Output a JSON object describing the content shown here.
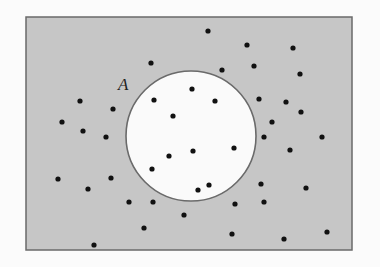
{
  "diagram": {
    "type": "venn-set-with-points",
    "colors": {
      "page_background": "#fbfbfb",
      "universe_fill": "#c6c6c6",
      "universe_stroke": "#6a6a6a",
      "set_fill": "#fafafa",
      "set_stroke": "#6a6a6a",
      "point": "#111111",
      "label": "#222222"
    },
    "universe": {
      "x": 26,
      "y": 17,
      "width": 326,
      "height": 233
    },
    "set_A": {
      "label": "A",
      "label_x": 118,
      "label_y": 90,
      "cx": 191,
      "cy": 136,
      "r": 65
    },
    "point_radius": 2.6,
    "points_inside_A": [
      [
        192,
        89
      ],
      [
        154,
        100
      ],
      [
        215,
        101
      ],
      [
        173,
        116
      ],
      [
        169,
        156
      ],
      [
        193,
        151
      ],
      [
        234,
        148
      ],
      [
        152,
        169
      ],
      [
        209,
        185
      ],
      [
        198,
        190
      ]
    ],
    "points_outside_A": [
      [
        208,
        31
      ],
      [
        247,
        45
      ],
      [
        293,
        48
      ],
      [
        151,
        63
      ],
      [
        222,
        70
      ],
      [
        254,
        66
      ],
      [
        300,
        74
      ],
      [
        80,
        101
      ],
      [
        113,
        109
      ],
      [
        259,
        99
      ],
      [
        286,
        102
      ],
      [
        301,
        112
      ],
      [
        62,
        122
      ],
      [
        83,
        131
      ],
      [
        106,
        137
      ],
      [
        272,
        122
      ],
      [
        264,
        137
      ],
      [
        322,
        137
      ],
      [
        290,
        150
      ],
      [
        58,
        179
      ],
      [
        111,
        178
      ],
      [
        88,
        189
      ],
      [
        129,
        202
      ],
      [
        153,
        202
      ],
      [
        184,
        215
      ],
      [
        144,
        228
      ],
      [
        94,
        245
      ],
      [
        261,
        184
      ],
      [
        306,
        188
      ],
      [
        235,
        204
      ],
      [
        264,
        202
      ],
      [
        232,
        234
      ],
      [
        284,
        239
      ],
      [
        327,
        232
      ]
    ]
  }
}
